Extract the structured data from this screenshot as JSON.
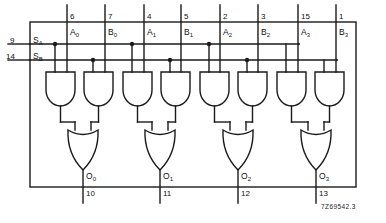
{
  "figure": {
    "caption": "7Z69542.3"
  },
  "select_inputs": [
    {
      "pin": "9",
      "name": "S",
      "sub": "A",
      "label": "SA"
    },
    {
      "pin": "14",
      "name": "S",
      "sub": "B",
      "label": "SB"
    }
  ],
  "data_inputs": [
    {
      "pin": "6",
      "name": "A",
      "sub": "0",
      "label": "A0",
      "x": 67
    },
    {
      "pin": "7",
      "name": "B",
      "sub": "0",
      "label": "B0",
      "x": 105
    },
    {
      "pin": "4",
      "name": "A",
      "sub": "1",
      "label": "A1",
      "x": 144
    },
    {
      "pin": "5",
      "name": "B",
      "sub": "1",
      "label": "B1",
      "x": 181
    },
    {
      "pin": "2",
      "name": "A",
      "sub": "2",
      "label": "A2",
      "x": 220
    },
    {
      "pin": "3",
      "name": "B",
      "sub": "2",
      "label": "B2",
      "x": 258
    },
    {
      "pin": "15",
      "name": "A",
      "sub": "3",
      "label": "A3",
      "x": 298
    },
    {
      "pin": "1",
      "name": "B",
      "sub": "3",
      "label": "B3",
      "x": 336
    }
  ],
  "outputs": [
    {
      "pin": "10",
      "name": "O",
      "sub": "0",
      "label": "O0",
      "x": 83
    },
    {
      "pin": "11",
      "name": "O",
      "sub": "1",
      "label": "O1",
      "x": 160
    },
    {
      "pin": "12",
      "name": "O",
      "sub": "2",
      "label": "O2",
      "x": 238
    },
    {
      "pin": "13",
      "name": "O",
      "sub": "3",
      "label": "O3",
      "x": 316
    }
  ],
  "gates": {
    "and_count": 8,
    "or_count": 4,
    "and_label": "AND",
    "or_label": "OR"
  },
  "colors": {
    "line": "#1a1a1a",
    "text": "#111111",
    "background": "#ffffff"
  }
}
